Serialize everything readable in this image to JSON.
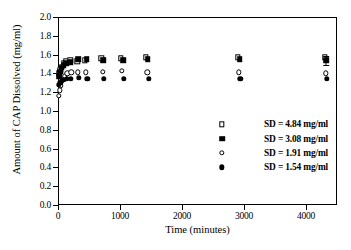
{
  "chart_data": {
    "type": "scatter",
    "title": "",
    "xlabel": "Time (minutes)",
    "ylabel": "Amount of CAP Dissolved (mg/ml)",
    "xlim": [
      0,
      4500
    ],
    "ylim": [
      0.0,
      2.0
    ],
    "xticks": [
      0,
      1000,
      2000,
      3000,
      4000
    ],
    "xtick_labels": [
      "0",
      "1000",
      "2000",
      "3000",
      "4000"
    ],
    "yticks": [
      0.0,
      0.2,
      0.4,
      0.6,
      0.8,
      1.0,
      1.2,
      1.4,
      1.6,
      1.8,
      2.0
    ],
    "ytick_labels": [
      "0.0",
      "0.2",
      "0.4",
      "0.6",
      "0.8",
      "1.0",
      "1.2",
      "1.4",
      "1.6",
      "1.8",
      "2.0"
    ],
    "grid": false,
    "legend_position": "center-right",
    "series": [
      {
        "name": "SD = 4.84 mg/ml",
        "label": "SD = 4.84 mg/ml",
        "marker": "open-square",
        "color": "#000000",
        "points": [
          {
            "x": 15,
            "y": 1.4
          },
          {
            "x": 35,
            "y": 1.44
          },
          {
            "x": 60,
            "y": 1.47
          },
          {
            "x": 90,
            "y": 1.51
          },
          {
            "x": 130,
            "y": 1.53
          },
          {
            "x": 200,
            "y": 1.54
          },
          {
            "x": 310,
            "y": 1.53
          },
          {
            "x": 430,
            "y": 1.54
          },
          {
            "x": 700,
            "y": 1.56
          },
          {
            "x": 1010,
            "y": 1.56
          },
          {
            "x": 1420,
            "y": 1.57
          },
          {
            "x": 2900,
            "y": 1.57
          },
          {
            "x": 4300,
            "y": 1.57
          }
        ]
      },
      {
        "name": "SD = 3.08 mg/ml",
        "label": "SD = 3.08 mg/ml",
        "marker": "filled-square",
        "color": "#000000",
        "points": [
          {
            "x": 15,
            "y": 1.37
          },
          {
            "x": 35,
            "y": 1.42
          },
          {
            "x": 60,
            "y": 1.46
          },
          {
            "x": 90,
            "y": 1.49
          },
          {
            "x": 130,
            "y": 1.51
          },
          {
            "x": 200,
            "y": 1.52
          },
          {
            "x": 330,
            "y": 1.55
          },
          {
            "x": 460,
            "y": 1.55
          },
          {
            "x": 730,
            "y": 1.54
          },
          {
            "x": 1050,
            "y": 1.54
          },
          {
            "x": 1450,
            "y": 1.55
          },
          {
            "x": 2930,
            "y": 1.55
          },
          {
            "x": 4330,
            "y": 1.54,
            "yerr": 0.05
          }
        ]
      },
      {
        "name": "SD = 1.91 mg/ml",
        "label": "SD = 1.91 mg/ml",
        "marker": "open-circle",
        "color": "#000000",
        "points": [
          {
            "x": 15,
            "y": 1.16
          },
          {
            "x": 30,
            "y": 1.22
          },
          {
            "x": 50,
            "y": 1.27
          },
          {
            "x": 75,
            "y": 1.33
          },
          {
            "x": 105,
            "y": 1.37
          },
          {
            "x": 150,
            "y": 1.4
          },
          {
            "x": 215,
            "y": 1.41
          },
          {
            "x": 320,
            "y": 1.41
          },
          {
            "x": 450,
            "y": 1.41
          },
          {
            "x": 720,
            "y": 1.42
          },
          {
            "x": 1030,
            "y": 1.43
          },
          {
            "x": 1440,
            "y": 1.41
          },
          {
            "x": 2920,
            "y": 1.41
          },
          {
            "x": 4320,
            "y": 1.4
          }
        ]
      },
      {
        "name": "SD = 1.54 mg/ml",
        "label": "SD = 1.54 mg/ml",
        "marker": "filled-circle",
        "color": "#000000",
        "points": [
          {
            "x": 15,
            "y": 1.28
          },
          {
            "x": 35,
            "y": 1.3
          },
          {
            "x": 60,
            "y": 1.32
          },
          {
            "x": 95,
            "y": 1.33
          },
          {
            "x": 140,
            "y": 1.34
          },
          {
            "x": 210,
            "y": 1.34
          },
          {
            "x": 340,
            "y": 1.35
          },
          {
            "x": 470,
            "y": 1.34
          },
          {
            "x": 740,
            "y": 1.34
          },
          {
            "x": 1060,
            "y": 1.34
          },
          {
            "x": 1460,
            "y": 1.34
          },
          {
            "x": 2940,
            "y": 1.34
          },
          {
            "x": 4340,
            "y": 1.34
          }
        ]
      }
    ]
  }
}
